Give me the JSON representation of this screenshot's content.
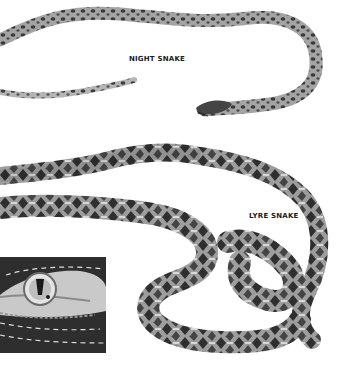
{
  "illustration": {
    "labels": {
      "night_snake": "NIGHT SNAKE",
      "lyre_snake": "LYRE SNAKE"
    },
    "colors": {
      "background": "#ffffff",
      "snake_light": "#b8b8b8",
      "snake_dark": "#3a3a3a",
      "inset_background": "#2e2e2e",
      "label_text": "#1a1a1a"
    },
    "figures": [
      {
        "name": "Night snake",
        "description": "slender spotted snake, head lower right, tail lower left"
      },
      {
        "name": "Lyre snake",
        "description": "heavy blotched snake coiling across lower half"
      },
      {
        "name": "Head detail inset",
        "description": "close-up of eye with vertical pupil on dark background with dashed lines"
      }
    ]
  }
}
